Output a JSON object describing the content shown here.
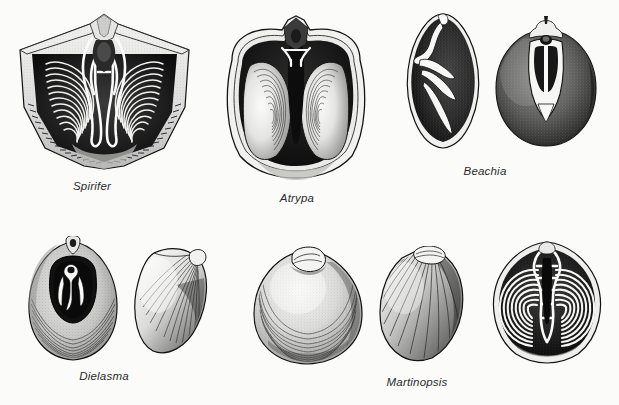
{
  "plate": {
    "title": "Brachiopod morphology plate",
    "description": "Engraved scientific illustration plate of eight brachiopod specimens in two rows, showing external valves and internal brachidial (lophophore support) structures.",
    "background_color": "#fbfbfa",
    "ink_color": "#1a1a1a",
    "width": 619,
    "height": 405,
    "rows": 2,
    "specimen_count": 8
  },
  "captions": [
    {
      "id": "spirifer",
      "label": "Spirifer",
      "x": 92,
      "y": 180,
      "row": 1
    },
    {
      "id": "atrypa",
      "label": "Atrypa",
      "x": 297,
      "y": 192,
      "row": 1
    },
    {
      "id": "beachia",
      "label": "Beachia",
      "x": 485,
      "y": 165,
      "row": 1
    },
    {
      "id": "dielasma",
      "label": "Dielasma",
      "x": 104,
      "y": 370,
      "row": 2
    },
    {
      "id": "martinopsis",
      "label": "Martinopsis",
      "x": 417,
      "y": 376,
      "row": 2
    }
  ],
  "specimens": [
    {
      "id": "spirifer-interior",
      "genus": "Spirifer",
      "view": "interior with spiralia",
      "row": 1,
      "position": 1,
      "box": {
        "x": 12,
        "y": 12,
        "w": 185,
        "h": 160
      },
      "features": "wide winged shell, paired conical spiral brachidium, radial costae, crenulated hinge margin"
    },
    {
      "id": "atrypa-interior",
      "genus": "Atrypa",
      "view": "interior with spiralia",
      "row": 1,
      "position": 2,
      "box": {
        "x": 216,
        "y": 14,
        "w": 160,
        "h": 168
      },
      "features": "subcircular outline, two large lateral spiral cones, dark median cavity, beak notch"
    },
    {
      "id": "beachia-section",
      "genus": "Beachia",
      "view": "longitudinal section",
      "row": 1,
      "position": 3,
      "box": {
        "x": 400,
        "y": 12,
        "w": 86,
        "h": 140
      },
      "features": "teardrop outline, pale loop and pedicle collar against dark matrix"
    },
    {
      "id": "beachia-interior",
      "genus": "Beachia",
      "view": "interior with loop",
      "row": 1,
      "position": 4,
      "box": {
        "x": 490,
        "y": 12,
        "w": 112,
        "h": 140
      },
      "features": "rounded shell, short pale loop with paired dental plates"
    },
    {
      "id": "dielasma-interior",
      "genus": "Dielasma",
      "view": "interior with loop",
      "row": 2,
      "position": 1,
      "box": {
        "x": 24,
        "y": 236,
        "w": 98,
        "h": 125
      },
      "features": "ovate shell, dark visceral cavity, short pale terebratulid loop, foramen at beak"
    },
    {
      "id": "dielasma-exterior",
      "genus": "Dielasma",
      "view": "exterior, oblique",
      "row": 2,
      "position": 2,
      "box": {
        "x": 130,
        "y": 245,
        "w": 86,
        "h": 112
      },
      "features": "smooth oblique valve with growth lines"
    },
    {
      "id": "martinopsis-exterior-front",
      "genus": "Martinopsis",
      "view": "exterior, ventral",
      "row": 2,
      "position": 3,
      "box": {
        "x": 250,
        "y": 244,
        "w": 118,
        "h": 122
      },
      "features": "broadly rounded smooth valve with concentric growth lines and prominent beak"
    },
    {
      "id": "martinopsis-exterior-side",
      "genus": "Martinopsis",
      "view": "exterior, lateral",
      "row": 2,
      "position": 4,
      "box": {
        "x": 374,
        "y": 246,
        "w": 98,
        "h": 118
      },
      "features": "oblique lateral view with radial ribbing and incurved beak"
    },
    {
      "id": "martinopsis-interior",
      "genus": "Martinopsis",
      "view": "interior with spiralia",
      "row": 2,
      "position": 5,
      "box": {
        "x": 486,
        "y": 238,
        "w": 122,
        "h": 128
      },
      "features": "paired laterally-directed spiral cones, median jugum, dark shell interior"
    }
  ]
}
